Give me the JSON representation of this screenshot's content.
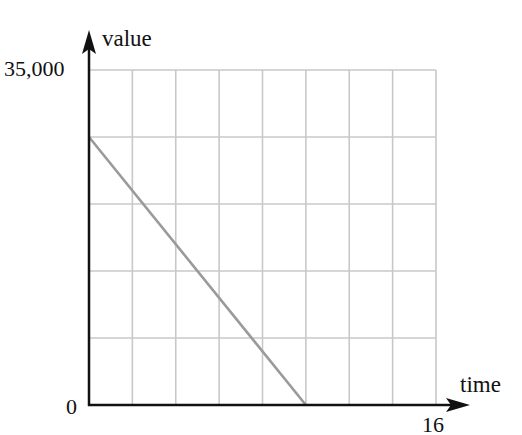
{
  "chart_data": {
    "type": "line",
    "title": "",
    "xlabel": "time",
    "ylabel": "value",
    "xlim": [
      0,
      16
    ],
    "ylim": [
      0,
      35000
    ],
    "x_tick_labels": [
      "16"
    ],
    "y_tick_labels": [
      "0",
      "35,000"
    ],
    "origin_label": "0",
    "grid": true,
    "grid_columns": 8,
    "grid_rows": 5,
    "x_step": 2,
    "y_step": 7000,
    "series": [
      {
        "name": "value",
        "color": "#9a9a9a",
        "points": [
          {
            "x": 0,
            "y": 28000
          },
          {
            "x": 10,
            "y": 0
          }
        ]
      }
    ],
    "legend": null
  },
  "labels": {
    "y_axis_title": "value",
    "x_axis_title": "time",
    "y_max": "35,000",
    "origin": "0",
    "x_max": "16"
  },
  "colors": {
    "axis": "#111111",
    "grid": "#c8c8c8",
    "line": "#9a9a9a"
  }
}
